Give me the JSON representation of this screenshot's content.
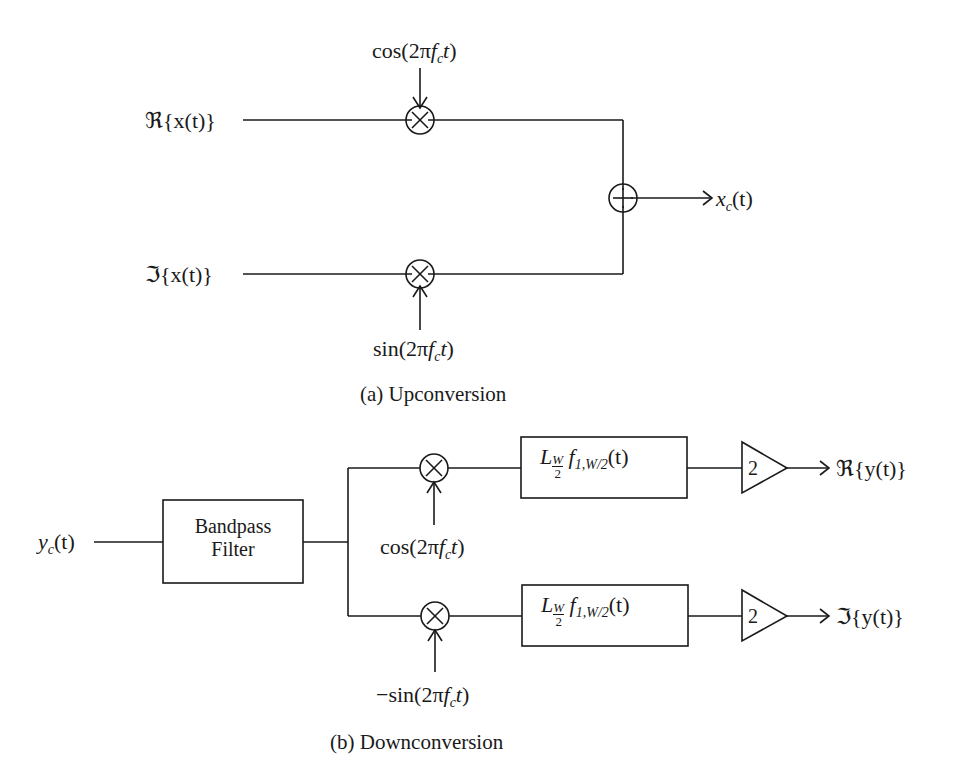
{
  "upconversion": {
    "caption": "(a) Upconversion",
    "input_real": "ℜ{x(t)}",
    "input_imag": "ℑ{x(t)}",
    "carrier_top": "cos(2πf_c t)",
    "carrier_bottom": "sin(2πf_c t)",
    "mixer_symbol": "×",
    "adder_symbol": "+",
    "output": "x_c(t)"
  },
  "downconversion": {
    "caption": "(b) Downconversion",
    "input": "y_c(t)",
    "bandpass_line1": "Bandpass",
    "bandpass_line2": "Filter",
    "carrier_top": "cos(2πf_c t)",
    "carrier_bottom": "−sin(2πf_c t)",
    "lowpass_filter_label": "L_{W/2} f_{1,W/2}(t)",
    "gain": "2",
    "output_real": "ℜ{y(t)}",
    "output_imag": "ℑ{y(t)}"
  },
  "text": {
    "re_x": "ℜ{x(t)}",
    "im_x": "ℑ{x(t)}",
    "cos": "cos(2π",
    "sin": "sin(2π",
    "neg_sin": "−sin(2π",
    "f": "f",
    "c": "c",
    "t_close": "t)",
    "x": "x",
    "paren_t": "(t)",
    "y": "y",
    "L": "L",
    "W": "W",
    "two": "2",
    "f1": "f",
    "sub1W2": "1,W/2",
    "re_y": "ℜ{y(t)}",
    "im_y": "ℑ{y(t)}"
  }
}
